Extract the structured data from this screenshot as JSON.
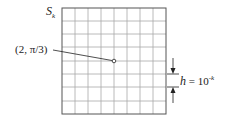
{
  "figure": {
    "region_label": {
      "main": "S",
      "subscript": "k"
    },
    "point_label": "(2, π/3)",
    "spacing_label": {
      "var": "h",
      "eq": " = 10",
      "exponent": "-k"
    },
    "grid": {
      "columns": 8,
      "rows": 8
    },
    "point": {
      "grid_x": 4,
      "grid_y": 4
    },
    "colors": {
      "grid": "#a8a8a8",
      "border": "#555555",
      "ink": "#222222"
    }
  }
}
